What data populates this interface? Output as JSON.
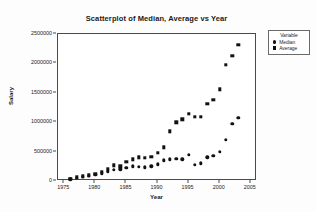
{
  "chart_data": {
    "type": "scatter",
    "title": "Scatterplot of Median, Average vs Year",
    "xlabel": "Year",
    "ylabel": "Salary",
    "xlim": [
      1974,
      2006
    ],
    "ylim": [
      0,
      2500000
    ],
    "xticks": [
      "1975",
      "1980",
      "1985",
      "1990",
      "1995",
      "2000",
      "2005"
    ],
    "xtick_values": [
      1975,
      1980,
      1985,
      1990,
      1995,
      2000,
      2005
    ],
    "yticks": [
      "0",
      "500000",
      "1000000",
      "1500000",
      "2000000",
      "2500000"
    ],
    "ytick_values": [
      0,
      500000,
      1000000,
      1500000,
      2000000,
      2500000
    ],
    "grid": false,
    "legend_title": "Variable",
    "legend_position": "right-outside",
    "series": [
      {
        "name": "Median",
        "marker": "circle",
        "color": "#111111",
        "points": [
          {
            "x": 1976,
            "y": 30000
          },
          {
            "x": 1977,
            "y": 52000
          },
          {
            "x": 1978,
            "y": 68000
          },
          {
            "x": 1979,
            "y": 85000
          },
          {
            "x": 1980,
            "y": 105000
          },
          {
            "x": 1981,
            "y": 130000
          },
          {
            "x": 1982,
            "y": 160000
          },
          {
            "x": 1983,
            "y": 195000
          },
          {
            "x": 1984,
            "y": 200000
          },
          {
            "x": 1985,
            "y": 225000
          },
          {
            "x": 1986,
            "y": 250000
          },
          {
            "x": 1987,
            "y": 240000
          },
          {
            "x": 1988,
            "y": 230000
          },
          {
            "x": 1989,
            "y": 250000
          },
          {
            "x": 1990,
            "y": 285000
          },
          {
            "x": 1991,
            "y": 350000
          },
          {
            "x": 1992,
            "y": 370000
          },
          {
            "x": 1993,
            "y": 380000
          },
          {
            "x": 1994,
            "y": 370000
          },
          {
            "x": 1995,
            "y": 450000
          },
          {
            "x": 1996,
            "y": 275000
          },
          {
            "x": 1997,
            "y": 300000
          },
          {
            "x": 1998,
            "y": 400000
          },
          {
            "x": 1999,
            "y": 425000
          },
          {
            "x": 2000,
            "y": 500000
          },
          {
            "x": 2001,
            "y": 700000
          },
          {
            "x": 2002,
            "y": 975000
          },
          {
            "x": 2003,
            "y": 1070000
          }
        ]
      },
      {
        "name": "Average",
        "marker": "square",
        "color": "#111111",
        "points": [
          {
            "x": 1976,
            "y": 35000
          },
          {
            "x": 1977,
            "y": 60000
          },
          {
            "x": 1978,
            "y": 80000
          },
          {
            "x": 1979,
            "y": 100000
          },
          {
            "x": 1980,
            "y": 125000
          },
          {
            "x": 1981,
            "y": 160000
          },
          {
            "x": 1982,
            "y": 200000
          },
          {
            "x": 1983,
            "y": 265000
          },
          {
            "x": 1984,
            "y": 250000
          },
          {
            "x": 1985,
            "y": 330000
          },
          {
            "x": 1986,
            "y": 370000
          },
          {
            "x": 1987,
            "y": 400000
          },
          {
            "x": 1988,
            "y": 395000
          },
          {
            "x": 1989,
            "y": 415000
          },
          {
            "x": 1990,
            "y": 475000
          },
          {
            "x": 1991,
            "y": 575000
          },
          {
            "x": 1992,
            "y": 845000
          },
          {
            "x": 1993,
            "y": 1000000
          },
          {
            "x": 1994,
            "y": 1050000
          },
          {
            "x": 1995,
            "y": 1140000
          },
          {
            "x": 1996,
            "y": 1090000
          },
          {
            "x": 1997,
            "y": 1090000
          },
          {
            "x": 1998,
            "y": 1310000
          },
          {
            "x": 1999,
            "y": 1380000
          },
          {
            "x": 2000,
            "y": 1560000
          },
          {
            "x": 2001,
            "y": 1975000
          },
          {
            "x": 2002,
            "y": 2125000
          },
          {
            "x": 2003,
            "y": 2320000
          }
        ]
      }
    ]
  }
}
